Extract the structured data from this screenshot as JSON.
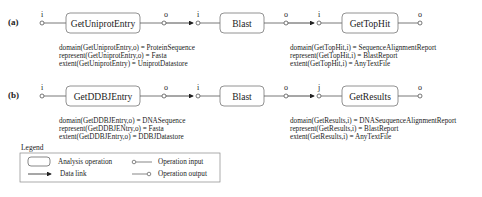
{
  "diagram": {
    "workflows": [
      {
        "label": "(a)",
        "ops": [
          "GetUniprotEntry",
          "Blast",
          "GetTopHit"
        ],
        "ports": {
          "in": "i",
          "out": "o"
        },
        "annot_left": [
          "domain(GetUniprotEntry,o) = ProteinSequence",
          "represent(GetUniprotEntry,o) = Fasta",
          "extent(GetUniprotEntry) = UniprotDatastore"
        ],
        "annot_right": [
          "domain(GetTopHit,i) = SequenceAlignmentReport",
          "represent(GetTopHit,i) = BlastReport",
          "extent(GetTopHit,i) = AnyTextFile"
        ]
      },
      {
        "label": "(b)",
        "ops": [
          "GetDDBJEntry",
          "Blast",
          "GetResults"
        ],
        "ports": {
          "in": "i",
          "out": "o",
          "in_last": "j"
        },
        "annot_left": [
          "domain(GetDDBJEntry,o) = DNASequence",
          "represent(GetDDBJENtry,o) = Fasta",
          "extent(GetDDBJEntry,o) = DDBJDatastore"
        ],
        "annot_right": [
          "domain(GetResults,i) = DNASeuquenceAlignmentReport",
          "represent(GetResults,i) = BlastReport",
          "extent(GetResults,i) = AnyTextFile"
        ]
      }
    ],
    "legend": {
      "title": "Legend",
      "items": [
        "Analysis operation",
        "Data link",
        "Operation input",
        "Operation output"
      ]
    },
    "colors": {
      "line": "#555555",
      "text": "#222222",
      "box": "#777777"
    }
  }
}
